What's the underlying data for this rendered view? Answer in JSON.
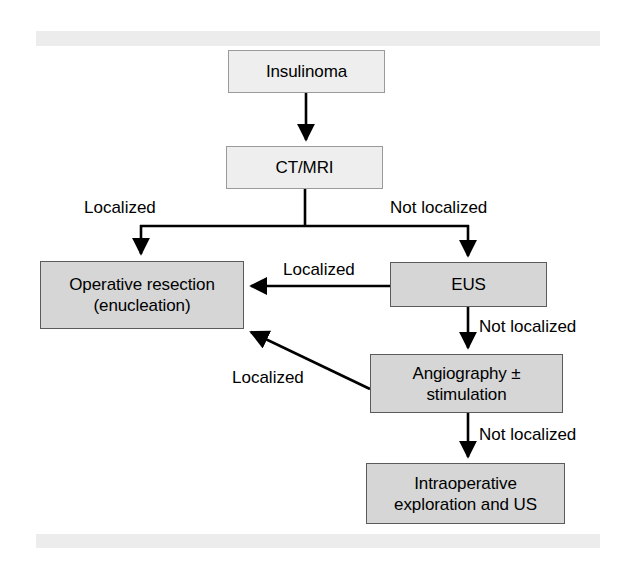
{
  "figure": {
    "type": "flowchart",
    "bands": {
      "top_band": "",
      "bottom_band": ""
    },
    "colors": {
      "light_box_fill": "#eeeeee",
      "dark_box_fill": "#d6d6d6",
      "light_box_border": "#9a9a9a",
      "dark_box_border": "#5b5b5b",
      "edge_stroke": "#000000",
      "band_fill": "#ececec",
      "page_background": "#ffffff",
      "text": "#000000"
    }
  },
  "nodes": {
    "insulinoma": {
      "label": "Insulinoma",
      "style": "light"
    },
    "ctmri": {
      "label": "CT/MRI",
      "style": "light"
    },
    "operative": {
      "line1": "Operative resection",
      "line2": "(enucleation)",
      "style": "dark"
    },
    "eus": {
      "label": "EUS",
      "style": "dark"
    },
    "angiography": {
      "line1": "Angiography ±",
      "line2": "stimulation",
      "style": "dark"
    },
    "intraoperative": {
      "line1": "Intraoperative",
      "line2": "exploration and US",
      "style": "dark"
    }
  },
  "edges": [
    {
      "id": "insulinoma-to-ctmri",
      "from": "insulinoma",
      "to": "ctmri",
      "label": ""
    },
    {
      "id": "ctmri-to-operative",
      "from": "ctmri",
      "to": "operative",
      "label": "Localized"
    },
    {
      "id": "ctmri-to-eus",
      "from": "ctmri",
      "to": "eus",
      "label": "Not localized"
    },
    {
      "id": "eus-to-operative",
      "from": "eus",
      "to": "operative",
      "label": "Localized"
    },
    {
      "id": "eus-to-angiography",
      "from": "eus",
      "to": "angiography",
      "label": "Not localized"
    },
    {
      "id": "angiography-to-operative",
      "from": "angiography",
      "to": "operative",
      "label": "Localized"
    },
    {
      "id": "angiography-to-intraoperative",
      "from": "angiography",
      "to": "intraoperative",
      "label": "Not localized"
    }
  ],
  "edge_labels": {
    "ctmri_localized": "Localized",
    "ctmri_not_localized": "Not localized",
    "eus_localized": "Localized",
    "eus_not_localized": "Not localized",
    "angio_localized": "Localized",
    "angio_not_localized": "Not localized"
  }
}
